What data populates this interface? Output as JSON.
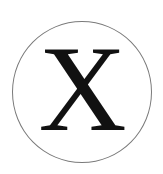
{
  "icon": {
    "name": "x-circle-icon",
    "letter": "X",
    "ring_color": "#7a7a7a",
    "letter_color": "#111111",
    "background": "#ffffff"
  }
}
